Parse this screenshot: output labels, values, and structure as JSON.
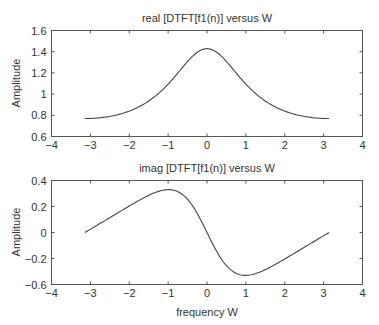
{
  "chart_data": [
    {
      "type": "line",
      "title": "real [DTFT[f1(n)] versus W",
      "xlabel": "",
      "ylabel": "Amplitude",
      "xlim": [
        -4,
        4
      ],
      "ylim": [
        0.6,
        1.6
      ],
      "xticks": [
        "-4",
        "-3",
        "-2",
        "-1",
        "0",
        "1",
        "2",
        "3",
        "4"
      ],
      "yticks": [
        "1.6",
        "1.4",
        "1.2",
        "1",
        "0.8",
        "0.6"
      ],
      "grid": false,
      "series": [
        {
          "name": "real",
          "x": [
            -3.1416,
            -2.8,
            -2.4,
            -2.0,
            -1.6,
            -1.2,
            -0.8,
            -0.4,
            0.0,
            0.4,
            0.8,
            1.2,
            1.6,
            2.0,
            2.4,
            2.8,
            3.1416
          ],
          "y": [
            0.769,
            0.776,
            0.8,
            0.846,
            0.921,
            1.036,
            1.195,
            1.357,
            1.429,
            1.357,
            1.195,
            1.036,
            0.921,
            0.846,
            0.8,
            0.776,
            0.769
          ]
        }
      ]
    },
    {
      "type": "line",
      "title": "imag [DTFT[f1(n)] versus W",
      "xlabel": "frequency W",
      "ylabel": "Amplitude",
      "xlim": [
        -4,
        4
      ],
      "ylim": [
        -0.4,
        0.4
      ],
      "xticks": [
        "-4",
        "-3",
        "-2",
        "-1",
        "0",
        "1",
        "2",
        "3",
        "4"
      ],
      "yticks": [
        "0.4",
        "0.2",
        "0",
        "-0.2",
        "-0.6"
      ],
      "grid": false,
      "series": [
        {
          "name": "imag",
          "x": [
            -3.1416,
            -2.8,
            -2.4,
            -2.0,
            -1.6,
            -1.2,
            -0.8,
            -0.4,
            0.0,
            0.4,
            0.8,
            1.2,
            1.6,
            2.0,
            2.4,
            2.8,
            3.1416
          ],
          "y": [
            0.0,
            0.073,
            0.153,
            0.234,
            0.306,
            0.334,
            0.285,
            0.154,
            0.0,
            -0.154,
            -0.285,
            -0.334,
            -0.306,
            -0.234,
            -0.153,
            -0.073,
            0.0
          ]
        }
      ]
    }
  ],
  "a": 0.3
}
